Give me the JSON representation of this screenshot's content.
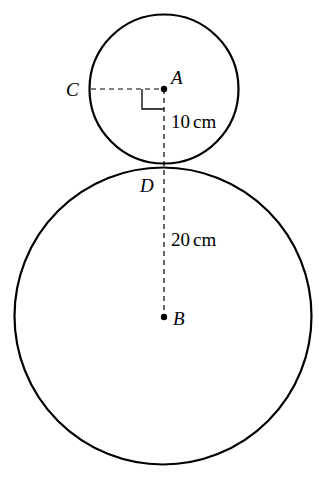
{
  "diagram": {
    "type": "geometry",
    "points": {
      "A": {
        "label": "A"
      },
      "B": {
        "label": "B"
      },
      "C": {
        "label": "C"
      },
      "D": {
        "label": "D"
      }
    },
    "measurements": {
      "small_radius": "10cm",
      "large_radius": "20cm",
      "small_radius_number": "10",
      "large_radius_number": "20",
      "unit": "cm"
    },
    "annotations": {
      "right_angle_at": "A",
      "dashed_segments": [
        "CA",
        "AB"
      ]
    },
    "colors": {
      "stroke": "#000000",
      "background": "#ffffff"
    }
  }
}
